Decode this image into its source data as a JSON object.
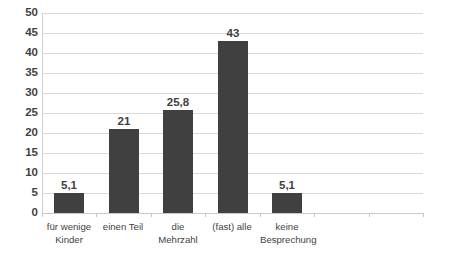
{
  "chart_data": {
    "type": "bar",
    "title": "",
    "subtitle": "",
    "xlabel": "",
    "ylabel": "",
    "categories": [
      "für wenige\nKinder",
      "einen Teil",
      "die Mehrzahl",
      "(fast) alle",
      "keine\nBesprechung"
    ],
    "values": [
      5.1,
      21,
      25.8,
      43,
      5.1
    ],
    "value_labels": [
      "5,1",
      "21",
      "25,8",
      "43",
      "5,1"
    ],
    "ylim": [
      0,
      50
    ],
    "ytick_values": [
      0,
      5,
      10,
      15,
      20,
      25,
      30,
      35,
      40,
      45,
      50
    ],
    "ytick_labels": [
      "0",
      "5",
      "10",
      "15",
      "20",
      "25",
      "30",
      "35",
      "40",
      "45",
      "50"
    ],
    "grid": true,
    "legend": false,
    "legend_position": "none",
    "bar_color": "#404040",
    "gridline_color": "#d9d9d9",
    "axis_color": "#c8c8c8",
    "text_color": "#3f3f3f",
    "background_color": "#ffffff",
    "n_axis_slots": 7
  }
}
